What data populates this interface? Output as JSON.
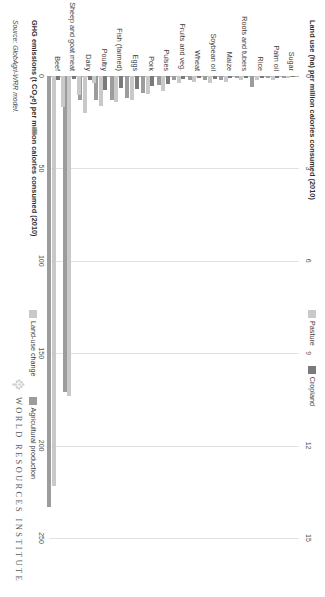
{
  "chart_data": {
    "type": "bar",
    "orientation": "horizontal",
    "title": "",
    "categories": [
      "Sugar",
      "Palm oil",
      "Rice",
      "Roots and tubers",
      "Maize",
      "Soybean oil",
      "Wheat",
      "Fruits and veg.",
      "Pulses",
      "Pork",
      "Eggs",
      "Fish (farmed)",
      "Poultry",
      "Dairy",
      "Sheep and goat meat",
      "Beef"
    ],
    "series": [
      {
        "name": "Pasture",
        "axis": "top",
        "color": "#c9c9c9",
        "values": [
          0,
          0,
          0,
          0,
          0,
          0,
          0,
          0,
          0,
          0,
          0,
          0,
          0,
          0.22,
          0.62,
          1.02
        ]
      },
      {
        "name": "Cropland",
        "axis": "top",
        "color": "#7a7a7a",
        "values": [
          0.03,
          0.05,
          0.06,
          0.06,
          0.08,
          0.1,
          0.08,
          0.11,
          0.27,
          0.33,
          0.42,
          0.4,
          0.45,
          0.14,
          0.1,
          0.12
        ]
      },
      {
        "name": "Land-use change",
        "axis": "bottom",
        "color": "#c9c9c9",
        "values": [
          1,
          2,
          2,
          2,
          3,
          4,
          3,
          4,
          8,
          10,
          13,
          14,
          16,
          20,
          173,
          222
        ]
      },
      {
        "name": "Agricultural production",
        "axis": "bottom",
        "color": "#9c9c9c",
        "values": [
          1,
          1,
          6,
          1,
          2,
          2,
          2,
          2,
          5,
          9,
          12,
          13,
          13,
          13,
          171,
          233
        ]
      }
    ],
    "top_axis": {
      "label": "Land use (ha) per million calories consumed (2010)",
      "ticks": [
        0,
        3,
        6,
        9,
        12,
        15
      ],
      "min": 0,
      "max": 15
    },
    "bottom_axis": {
      "label": "GHG emissions (t CO₂e) per million calories consumed (2010)",
      "ticks": [
        0,
        50,
        100,
        150,
        200,
        250
      ],
      "min": 0,
      "max": 250
    },
    "legend_top": [
      {
        "label": "Pasture",
        "color": "#c9c9c9"
      },
      {
        "label": "Cropland",
        "color": "#7a7a7a"
      }
    ],
    "legend_bottom": [
      {
        "label": "Land-use change",
        "color": "#c9c9c9"
      },
      {
        "label": "Agricultural production",
        "color": "#9c9c9c"
      }
    ],
    "grid": true,
    "legend_position": "top-right and middle-right"
  },
  "source": {
    "text": "Source: GlobAgri-WRR model."
  },
  "brand": {
    "text": "WORLD RESOURCES INSTITUTE"
  }
}
